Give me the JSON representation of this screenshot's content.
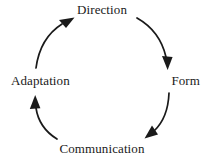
{
  "diagram": {
    "type": "cycle",
    "direction": "clockwise",
    "background_color": "#ffffff",
    "stroke_color": "#1a1a1a",
    "text_color": "#1a1a1a",
    "nodes": [
      {
        "id": "direction",
        "label": "Direction",
        "position": "top"
      },
      {
        "id": "form",
        "label": "Form",
        "position": "right"
      },
      {
        "id": "communication",
        "label": "Communication",
        "position": "bottom"
      },
      {
        "id": "adaptation",
        "label": "Adaptation",
        "position": "left"
      }
    ],
    "arrows": [
      {
        "from": "direction",
        "to": "form",
        "arrowhead": "down"
      },
      {
        "from": "form",
        "to": "communication",
        "arrowhead": "down-left"
      },
      {
        "from": "communication",
        "to": "adaptation",
        "arrowhead": "up"
      },
      {
        "from": "adaptation",
        "to": "direction",
        "arrowhead": "up-right"
      }
    ]
  }
}
